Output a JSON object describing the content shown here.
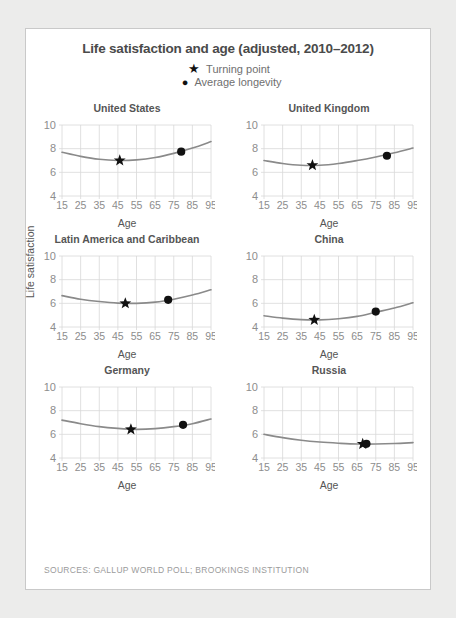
{
  "card": {
    "title": "Life satisfaction and age (adjusted, 2010–2012)",
    "source": "SOURCES: GALLUP WORLD POLL; BROOKINGS INSTITUTION"
  },
  "legend": {
    "items": [
      {
        "glyph": "★",
        "icon": "star-icon",
        "label": "Turning point"
      },
      {
        "glyph": "●",
        "icon": "circle-icon",
        "label": "Average longevity"
      }
    ]
  },
  "axes": {
    "ylabel": "Life satisfaction",
    "xlabel": "Age",
    "xticks": [
      "15",
      "25",
      "35",
      "45",
      "55",
      "65",
      "75",
      "85",
      "95"
    ],
    "yticks": [
      "4",
      "6",
      "8",
      "10"
    ]
  },
  "colors": {
    "curve": "#8a8a8a",
    "marker": "#111111",
    "grid": "#d8d8d8",
    "tick_text": "#8d8d8d",
    "title": "#4a4a4a",
    "page_bg": "#ececeb",
    "card_bg": "#ffffff",
    "card_border": "#c9c9c9",
    "source_text": "#9b9b9b"
  },
  "chart_data": {
    "type": "line",
    "title": "Life satisfaction and age (adjusted, 2010–2012)",
    "xlabel": "Age",
    "ylabel": "Life satisfaction",
    "xlim": [
      15,
      95
    ],
    "ylim": [
      4,
      10
    ],
    "grid": true,
    "legend": [
      "Turning point",
      "Average longevity"
    ],
    "legend_position": "top-center",
    "panel_layout": "3 rows x 2 columns",
    "panels": [
      {
        "name": "United States",
        "x": [
          15,
          25,
          35,
          45,
          55,
          65,
          75,
          85,
          95
        ],
        "y": [
          7.7,
          7.35,
          7.1,
          7.0,
          7.05,
          7.25,
          7.6,
          8.05,
          8.6
        ],
        "turning_point": {
          "age": 46,
          "value": 7.0
        },
        "average_longevity": {
          "age": 79,
          "value": 7.75
        }
      },
      {
        "name": "United Kingdom",
        "x": [
          15,
          25,
          35,
          45,
          55,
          65,
          75,
          85,
          95
        ],
        "y": [
          7.0,
          6.75,
          6.6,
          6.6,
          6.75,
          7.0,
          7.3,
          7.65,
          8.05
        ],
        "turning_point": {
          "age": 41,
          "value": 6.6
        },
        "average_longevity": {
          "age": 81,
          "value": 7.4
        }
      },
      {
        "name": "Latin America and Caribbean",
        "x": [
          15,
          25,
          35,
          45,
          55,
          65,
          75,
          85,
          95
        ],
        "y": [
          6.65,
          6.35,
          6.15,
          6.02,
          6.0,
          6.1,
          6.35,
          6.7,
          7.15
        ],
        "turning_point": {
          "age": 49,
          "value": 6.0
        },
        "average_longevity": {
          "age": 72,
          "value": 6.3
        }
      },
      {
        "name": "China",
        "x": [
          15,
          25,
          35,
          45,
          55,
          65,
          75,
          85,
          95
        ],
        "y": [
          4.95,
          4.75,
          4.62,
          4.6,
          4.7,
          4.9,
          5.25,
          5.6,
          6.05
        ],
        "turning_point": {
          "age": 42,
          "value": 4.6
        },
        "average_longevity": {
          "age": 75,
          "value": 5.3
        }
      },
      {
        "name": "Germany",
        "x": [
          15,
          25,
          35,
          45,
          55,
          65,
          75,
          85,
          95
        ],
        "y": [
          7.2,
          6.9,
          6.65,
          6.5,
          6.42,
          6.48,
          6.65,
          6.9,
          7.3
        ],
        "turning_point": {
          "age": 52,
          "value": 6.42
        },
        "average_longevity": {
          "age": 80,
          "value": 6.8
        }
      },
      {
        "name": "Russia",
        "x": [
          15,
          25,
          35,
          45,
          55,
          65,
          75,
          85,
          95
        ],
        "y": [
          6.0,
          5.72,
          5.5,
          5.35,
          5.25,
          5.18,
          5.18,
          5.22,
          5.3
        ],
        "turning_point": {
          "age": 68,
          "value": 5.18
        },
        "average_longevity": {
          "age": 70,
          "value": 5.2
        }
      }
    ]
  }
}
